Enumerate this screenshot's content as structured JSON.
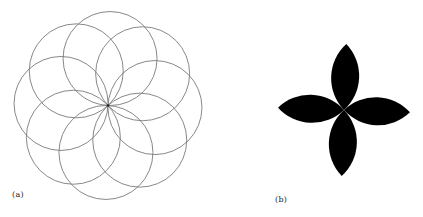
{
  "figure": {
    "panels": [
      {
        "id": "a",
        "label": "(a)",
        "description": "Eight circles of equal radius arranged rotationally, all passing through a common center point",
        "circle_count": 8,
        "center": [
          108,
          105.5
        ],
        "radius": 47,
        "rotation_deg": 2.5,
        "stroke_color": "#7a7a7a"
      },
      {
        "id": "b",
        "label": "(b)",
        "description": "Four black lens-shaped petals meeting at a center point, forming a cross/flower shape",
        "petal_count": 4,
        "center": [
          124,
          110
        ],
        "petal_length": 66,
        "petal_width": 28,
        "rotation_deg": 2,
        "fill_color": "#000000"
      }
    ]
  }
}
